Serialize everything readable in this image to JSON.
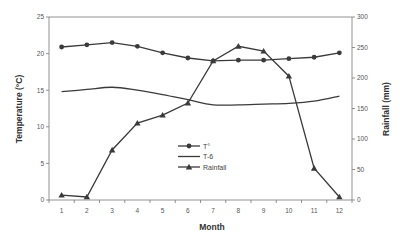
{
  "chart_data": {
    "type": "line",
    "title": "",
    "xlabel": "Month",
    "ylabel": "Temperature (°C)",
    "y2label": "Rainfall (mm)",
    "categories": [
      "1",
      "2",
      "3",
      "4",
      "5",
      "6",
      "7",
      "8",
      "9",
      "10",
      "11",
      "12"
    ],
    "ylim": [
      0,
      25
    ],
    "y2lim": [
      0,
      300
    ],
    "yticks": [
      0,
      5,
      10,
      15,
      20,
      25
    ],
    "y2ticks": [
      0,
      50,
      100,
      150,
      200,
      250,
      300
    ],
    "grid": false,
    "legend_position": "center",
    "series": [
      {
        "name": "T°",
        "axis": "left",
        "marker": "circle",
        "values": [
          20.9,
          21.2,
          21.5,
          21.0,
          20.1,
          19.4,
          19.0,
          19.1,
          19.1,
          19.3,
          19.5,
          20.1
        ]
      },
      {
        "name": "T-6",
        "axis": "left",
        "marker": "none",
        "values": [
          14.8,
          15.1,
          15.4,
          15.0,
          14.4,
          13.7,
          13.0,
          13.0,
          13.1,
          13.2,
          13.5,
          14.2
        ]
      },
      {
        "name": "Rainfall",
        "axis": "right",
        "marker": "triangle",
        "values": [
          8,
          5,
          82,
          126,
          139,
          159,
          228,
          252,
          244,
          203,
          52,
          5
        ]
      }
    ]
  }
}
